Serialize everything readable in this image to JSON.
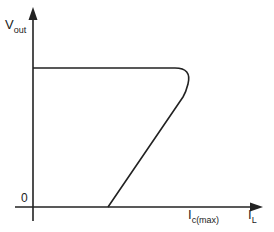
{
  "diagram": {
    "type": "foldback current limiting characteristic",
    "colors": {
      "stroke": "#222222",
      "background": "#ffffff"
    },
    "y_axis": {
      "label_main": "V",
      "label_sub": "out"
    },
    "x_axis": {
      "label_main": "I",
      "label_sub": "L"
    },
    "origin_label": "0",
    "marker_label": {
      "main": "I",
      "sub": "c(max)"
    },
    "curve": {
      "description": "Constant output voltage up to I_c(max), then foldback to reduced current at zero volts",
      "points": [
        [
          33,
          68
        ],
        [
          175,
          68
        ],
        [
          188,
          80
        ],
        [
          187,
          95
        ],
        [
          108,
          207
        ]
      ]
    }
  }
}
